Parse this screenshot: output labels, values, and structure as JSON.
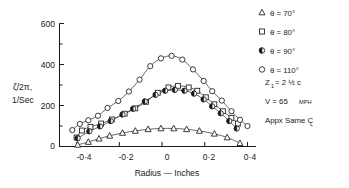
{
  "chart_data": {
    "type": "scatter",
    "title": "",
    "xlabel": "Radius — Inches",
    "ylabel_line1": "ζ/2π,",
    "ylabel_line2": "1/Sec",
    "xlim": [
      -0.48,
      0.44
    ],
    "ylim": [
      0,
      600
    ],
    "xticks": [
      -0.4,
      -0.2,
      0,
      0.2,
      0.4
    ],
    "xticklabels": [
      "-0·4",
      "-0·2",
      "0",
      "0·2",
      "0·4"
    ],
    "yticks": [
      0,
      200,
      400,
      600
    ],
    "yticklabels": [
      "0",
      "200",
      "400",
      "600"
    ],
    "yminorticks": [
      100,
      300,
      500
    ],
    "grid": false,
    "legend_position": "right",
    "series": [
      {
        "name": "θ = 70°",
        "marker": "triangle-up-open",
        "points": [
          {
            "x": -0.395,
            "y": 8
          },
          {
            "x": -0.345,
            "y": 22
          },
          {
            "x": -0.295,
            "y": 38
          },
          {
            "x": -0.245,
            "y": 52
          },
          {
            "x": -0.185,
            "y": 66
          },
          {
            "x": -0.125,
            "y": 76
          },
          {
            "x": -0.065,
            "y": 84
          },
          {
            "x": -0.005,
            "y": 88
          },
          {
            "x": 0.055,
            "y": 88
          },
          {
            "x": 0.115,
            "y": 84
          },
          {
            "x": 0.175,
            "y": 76
          },
          {
            "x": 0.245,
            "y": 62
          },
          {
            "x": 0.305,
            "y": 44
          },
          {
            "x": 0.365,
            "y": 16
          }
        ]
      },
      {
        "name": "θ = 80°",
        "marker": "square-open",
        "points": [
          {
            "x": -0.4,
            "y": 44
          },
          {
            "x": -0.375,
            "y": 78
          },
          {
            "x": -0.335,
            "y": 96
          },
          {
            "x": -0.285,
            "y": 112
          },
          {
            "x": -0.235,
            "y": 132
          },
          {
            "x": -0.175,
            "y": 160
          },
          {
            "x": -0.125,
            "y": 186
          },
          {
            "x": -0.075,
            "y": 218
          },
          {
            "x": -0.02,
            "y": 262
          },
          {
            "x": 0.03,
            "y": 288
          },
          {
            "x": 0.075,
            "y": 296
          },
          {
            "x": 0.125,
            "y": 288
          },
          {
            "x": 0.165,
            "y": 272
          },
          {
            "x": 0.205,
            "y": 240
          },
          {
            "x": 0.245,
            "y": 206
          },
          {
            "x": 0.285,
            "y": 172
          },
          {
            "x": 0.325,
            "y": 140
          },
          {
            "x": 0.355,
            "y": 112
          }
        ]
      },
      {
        "name": "θ = 90°",
        "marker": "circle-half-filled",
        "points": [
          {
            "x": -0.395,
            "y": 40
          },
          {
            "x": -0.34,
            "y": 74
          },
          {
            "x": -0.29,
            "y": 98
          },
          {
            "x": -0.24,
            "y": 124
          },
          {
            "x": -0.185,
            "y": 156
          },
          {
            "x": -0.135,
            "y": 184
          },
          {
            "x": -0.08,
            "y": 220
          },
          {
            "x": -0.03,
            "y": 252
          },
          {
            "x": 0.015,
            "y": 272
          },
          {
            "x": 0.06,
            "y": 276
          },
          {
            "x": 0.105,
            "y": 272
          },
          {
            "x": 0.15,
            "y": 258
          },
          {
            "x": 0.195,
            "y": 230
          },
          {
            "x": 0.235,
            "y": 196
          },
          {
            "x": 0.275,
            "y": 162
          },
          {
            "x": 0.315,
            "y": 124
          },
          {
            "x": 0.35,
            "y": 88
          }
        ]
      },
      {
        "name": "θ = 110°",
        "marker": "circle-open",
        "points": [
          {
            "x": -0.42,
            "y": 80
          },
          {
            "x": -0.385,
            "y": 110
          },
          {
            "x": -0.345,
            "y": 128
          },
          {
            "x": -0.3,
            "y": 150
          },
          {
            "x": -0.255,
            "y": 188
          },
          {
            "x": -0.205,
            "y": 222
          },
          {
            "x": -0.155,
            "y": 268
          },
          {
            "x": -0.105,
            "y": 326
          },
          {
            "x": -0.055,
            "y": 392
          },
          {
            "x": -0.005,
            "y": 430
          },
          {
            "x": 0.045,
            "y": 442
          },
          {
            "x": 0.095,
            "y": 424
          },
          {
            "x": 0.145,
            "y": 376
          },
          {
            "x": 0.195,
            "y": 320
          },
          {
            "x": 0.235,
            "y": 270
          },
          {
            "x": 0.28,
            "y": 224
          },
          {
            "x": 0.325,
            "y": 172
          },
          {
            "x": 0.365,
            "y": 130
          },
          {
            "x": 0.4,
            "y": 100
          }
        ]
      }
    ],
    "annotations": [
      {
        "text": "Z",
        "sub": "1",
        "rest": " = 2 ½ c"
      },
      {
        "text": "V = 65",
        "small": "MPH"
      },
      {
        "text": "Appx Same C",
        "sub": "L"
      }
    ]
  },
  "legend": {
    "entries": [
      {
        "marker": "triangle-up-open",
        "theta": "θ = 70°"
      },
      {
        "marker": "square-open",
        "theta": "θ = 80°"
      },
      {
        "marker": "circle-half-filled",
        "theta": "θ = 90°"
      },
      {
        "marker": "circle-open",
        "theta": "θ = 110°"
      }
    ],
    "note_z_main": "Z",
    "note_z_sub": "1",
    "note_z_rest": "= 2 ½ c",
    "note_v_main": "V = 65",
    "note_v_small": "MPH",
    "note_cl_main": "Appx Same C",
    "note_cl_sub": "L"
  },
  "axes": {
    "xlabel": "Radius — Inches",
    "ylabel_1": "ζ/2π,",
    "ylabel_2": "1/Sec",
    "x_tick_0": "-0·4",
    "x_tick_1": "-0·2",
    "x_tick_2": "0",
    "x_tick_3": "0·2",
    "x_tick_4": "0·4",
    "y_tick_0": "0",
    "y_tick_1": "200",
    "y_tick_2": "400",
    "y_tick_3": "600"
  },
  "colors": {
    "ink": "#1a1a1a",
    "curve": "#4a4a4a",
    "background": "#ffffff"
  }
}
